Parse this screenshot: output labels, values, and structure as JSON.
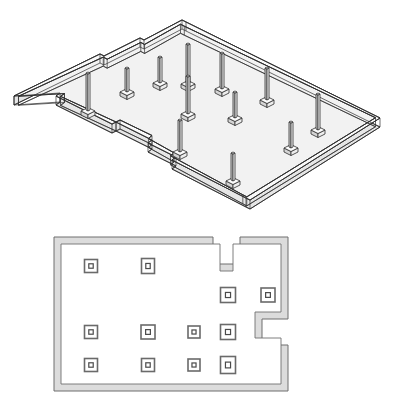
{
  "document": {
    "title": "Foundation Column Layout",
    "sheet_background": "#ffffff",
    "line_color": "#2e2e2e",
    "plan_wall_fill": "#dcdcdc",
    "plan_wall_stroke": "#6f6f6f",
    "iso_wall_fill": "#f2f2f2",
    "column_fill": "#d9d9d9"
  },
  "views": [
    {
      "id": "iso-view",
      "name": "isometric-foundation-view",
      "type": "axonometric",
      "description": "Isometric view of perimeter foundation wall with vertical columns"
    },
    {
      "id": "plan-view",
      "name": "floor-plan-view",
      "type": "plan",
      "description": "Plan view of the same footprint with square column pads"
    }
  ],
  "iso": {
    "projection": {
      "x_ratio": 1.0,
      "y_ratio": 0.5,
      "wall_height": 9,
      "band_lines": 3
    },
    "outline": [
      [
        14,
        96
      ],
      [
        100,
        54
      ],
      [
        104,
        56
      ],
      [
        140,
        38
      ],
      [
        144,
        40
      ],
      [
        182,
        20
      ],
      [
        186,
        22
      ],
      [
        380,
        118
      ],
      [
        250,
        200
      ],
      [
        246,
        198
      ],
      [
        172,
        160
      ],
      [
        176,
        157
      ],
      [
        148,
        143
      ],
      [
        152,
        140
      ],
      [
        116,
        122
      ],
      [
        112,
        124
      ],
      [
        56,
        96
      ],
      [
        60,
        93
      ]
    ],
    "outline_note": "Closed irregular hexadecagon footprint with two step notches on the upper-left edge and one on the lower-left edge",
    "columns": [
      {
        "x": 88,
        "y": 73,
        "h": 38,
        "label": "C1"
      },
      {
        "x": 127,
        "y": 68,
        "h": 24,
        "label": "C2"
      },
      {
        "x": 160,
        "y": 57,
        "h": 26,
        "label": "C3"
      },
      {
        "x": 188,
        "y": 44,
        "h": 40,
        "label": "C4"
      },
      {
        "x": 188,
        "y": 76,
        "h": 38,
        "label": "C5"
      },
      {
        "x": 222,
        "y": 53,
        "h": 36,
        "label": "C6"
      },
      {
        "x": 267,
        "y": 68,
        "h": 32,
        "label": "C7"
      },
      {
        "x": 235,
        "y": 92,
        "h": 26,
        "label": "C8"
      },
      {
        "x": 318,
        "y": 94,
        "h": 36,
        "label": "C9"
      },
      {
        "x": 180,
        "y": 120,
        "h": 32,
        "label": "C10"
      },
      {
        "x": 291,
        "y": 122,
        "h": 26,
        "label": "C11"
      },
      {
        "x": 233,
        "y": 153,
        "h": 28,
        "label": "C12"
      }
    ],
    "column_geometry": {
      "shaft_width": 4,
      "base_width": 14,
      "base_depth": 7,
      "base_height": 4,
      "cap_width": 11
    }
  },
  "plan": {
    "outline": [
      [
        54,
        18
      ],
      [
        213,
        18
      ],
      [
        213,
        45
      ],
      [
        240,
        45
      ],
      [
        240,
        18
      ],
      [
        288,
        18
      ],
      [
        288,
        100
      ],
      [
        262,
        100
      ],
      [
        262,
        126
      ],
      [
        288,
        126
      ],
      [
        288,
        172
      ],
      [
        54,
        172
      ]
    ],
    "outline_note": "Rectangular footprint with a notch cut into the top edge and a step notch on the right edge",
    "wall_thickness": 7,
    "pads": [
      {
        "x": 91,
        "y": 47,
        "w": 13,
        "h": 13,
        "label": "P1"
      },
      {
        "x": 148,
        "y": 47,
        "w": 13,
        "h": 15,
        "label": "P2"
      },
      {
        "x": 228,
        "y": 76,
        "w": 15,
        "h": 15,
        "label": "P3"
      },
      {
        "x": 268,
        "y": 76,
        "w": 14,
        "h": 14,
        "label": "P4"
      },
      {
        "x": 91,
        "y": 113,
        "w": 13,
        "h": 13,
        "label": "P5"
      },
      {
        "x": 148,
        "y": 113,
        "w": 14,
        "h": 14,
        "label": "P6"
      },
      {
        "x": 194,
        "y": 113,
        "w": 12,
        "h": 12,
        "label": "P7"
      },
      {
        "x": 228,
        "y": 113,
        "w": 15,
        "h": 15,
        "label": "P8"
      },
      {
        "x": 91,
        "y": 146,
        "w": 13,
        "h": 13,
        "label": "P9"
      },
      {
        "x": 148,
        "y": 146,
        "w": 13,
        "h": 13,
        "label": "P10"
      },
      {
        "x": 194,
        "y": 146,
        "w": 12,
        "h": 12,
        "label": "P11"
      },
      {
        "x": 228,
        "y": 146,
        "w": 15,
        "h": 17,
        "label": "P12"
      }
    ],
    "pad_inner_ratio": 0.34
  }
}
